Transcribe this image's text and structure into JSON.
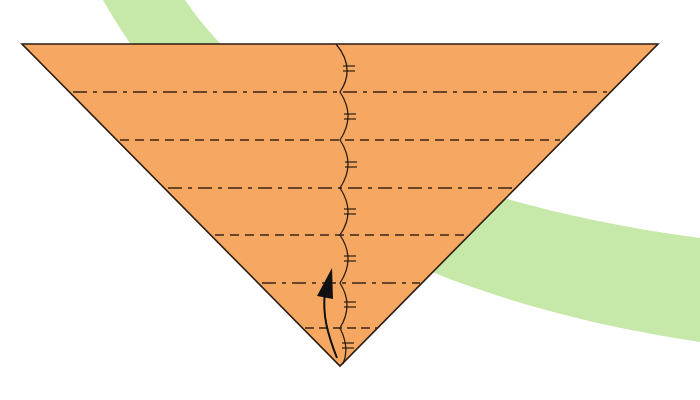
{
  "diagram": {
    "type": "origami-folding-step",
    "colors": {
      "background": "#ffffff",
      "paper": "#f6a862",
      "outline": "#2b1d12",
      "fold_line": "#3a2515",
      "band": "#c6e8a8",
      "arrow": "#111111"
    },
    "triangle": {
      "top_left": [
        22,
        44
      ],
      "top_right": [
        658,
        44
      ],
      "bottom": [
        340,
        366
      ]
    },
    "fold_lines": [
      {
        "y": 92,
        "style": "mountain",
        "pattern": "dash-dot"
      },
      {
        "y": 140,
        "style": "valley",
        "pattern": "dashed"
      },
      {
        "y": 188,
        "style": "mountain",
        "pattern": "dash-dot"
      },
      {
        "y": 235,
        "style": "valley",
        "pattern": "dashed"
      },
      {
        "y": 283,
        "style": "mountain",
        "pattern": "dash-dot"
      },
      {
        "y": 328,
        "style": "valley",
        "pattern": "dashed"
      }
    ],
    "equal_division_marks": 7,
    "arrow": {
      "direction": "up",
      "meaning": "fold up"
    }
  }
}
